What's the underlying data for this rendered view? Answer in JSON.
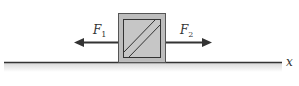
{
  "diagram": {
    "type": "free-body / force diagram",
    "block": {
      "fill": "#bdbdbd",
      "inner_fill": "#c8c8c8",
      "stroke": "#333333"
    },
    "forces": [
      {
        "label": "F",
        "subscript": "1",
        "direction": "left"
      },
      {
        "label": "F",
        "subscript": "2",
        "direction": "right"
      }
    ],
    "axis": {
      "label": "x",
      "color": "#333333"
    }
  }
}
